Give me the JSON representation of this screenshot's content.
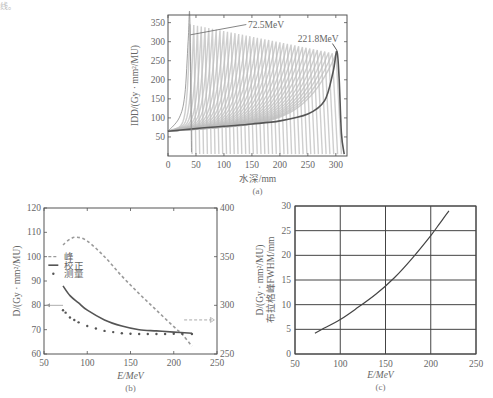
{
  "corner_text": "线。",
  "chart_data": [
    {
      "id": "a",
      "type": "line",
      "caption": "(a)",
      "title": "",
      "xlabel": "水深/mm",
      "ylabel": "IDD/(Gy · mm²/MU)",
      "xlim": [
        0,
        320
      ],
      "ylim": [
        0,
        370
      ],
      "xticks": [
        0,
        50,
        100,
        150,
        200,
        250,
        300
      ],
      "yticks": [
        50,
        100,
        150,
        200,
        250,
        300,
        350
      ],
      "grid": false,
      "annotations": [
        {
          "text": "72.5MeV",
          "x": 200,
          "y": 345
        },
        {
          "text": "221.8MeV",
          "x": 300,
          "y": 305
        }
      ],
      "description": "Family of integral depth dose (Bragg peak) curves from 72.5 MeV to 221.8 MeV; highlighted curve = 221.8 MeV",
      "series": [
        {
          "name": "221.8MeV",
          "x": [
            0,
            50,
            100,
            150,
            200,
            250,
            280,
            295,
            302,
            306,
            310,
            315
          ],
          "y": [
            65,
            72,
            78,
            84,
            92,
            110,
            145,
            220,
            275,
            200,
            60,
            5
          ]
        },
        {
          "name": "72.5MeV",
          "x": [
            0,
            20,
            30,
            36,
            39,
            42
          ],
          "y": [
            65,
            100,
            160,
            300,
            365,
            10
          ]
        }
      ]
    },
    {
      "id": "b",
      "type": "line",
      "caption": "(b)",
      "xlabel": "E/MeV",
      "ylabel": "D/(Gy · mm²/MU)",
      "xlim": [
        50,
        250
      ],
      "ylim": [
        60,
        120
      ],
      "y2lim": [
        250,
        400
      ],
      "xticks": [
        50,
        100,
        150,
        200,
        250
      ],
      "yticks": [
        60,
        70,
        80,
        90,
        100,
        110,
        120
      ],
      "y2ticks": [
        250,
        300,
        350,
        400
      ],
      "grid": false,
      "legend": {
        "position": "upper-left",
        "entries": [
          "峰",
          "校正",
          "测量"
        ]
      },
      "series": [
        {
          "name": "峰",
          "style": "dashed",
          "axis": "right",
          "x": [
            72,
            80,
            88,
            100,
            120,
            140,
            160,
            180,
            200,
            210,
            221
          ],
          "y": [
            362,
            368,
            370,
            366,
            350,
            330,
            312,
            295,
            278,
            270,
            258
          ]
        },
        {
          "name": "校正",
          "style": "solid",
          "axis": "left",
          "x": [
            72,
            80,
            90,
            100,
            120,
            140,
            160,
            180,
            200,
            221
          ],
          "y": [
            88,
            84,
            81,
            78,
            74,
            71.5,
            70,
            69.5,
            69,
            68.5
          ]
        },
        {
          "name": "测量",
          "style": "dotted",
          "axis": "left",
          "x": [
            72,
            75,
            80,
            85,
            90,
            100,
            110,
            120,
            130,
            140,
            150,
            160,
            170,
            180,
            190,
            200,
            210,
            221
          ],
          "y": [
            78,
            77,
            75,
            74,
            73,
            71.5,
            70.5,
            69.5,
            69,
            68.5,
            68.3,
            68.2,
            68.2,
            68.2,
            68.2,
            68.3,
            68.3,
            68.2
          ]
        }
      ],
      "annotations": [
        {
          "text": "arrow-left-to-left-axis",
          "y": 80
        },
        {
          "text": "arrow-right-to-right-axis",
          "y2": 285
        }
      ]
    },
    {
      "id": "c",
      "type": "line",
      "caption": "(c)",
      "xlabel": "E/MeV",
      "ylabel": "D/(Gy · mm²/MU) 布拉格峰FWHM/mm",
      "xlim": [
        50,
        250
      ],
      "ylim": [
        0,
        30
      ],
      "xticks": [
        50,
        100,
        150,
        200,
        250
      ],
      "yticks": [
        0,
        5,
        10,
        15,
        20,
        25,
        30
      ],
      "grid": true,
      "series": [
        {
          "name": "FWHM",
          "x": [
            72,
            80,
            100,
            120,
            140,
            160,
            180,
            200,
            210,
            220
          ],
          "y": [
            4.2,
            5,
            7,
            9.5,
            12.2,
            15.5,
            19.5,
            24,
            26.5,
            29
          ]
        }
      ]
    }
  ]
}
